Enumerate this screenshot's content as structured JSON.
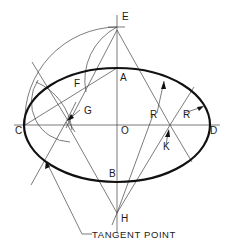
{
  "figure": {
    "labels": {
      "E": "E",
      "A": "A",
      "F": "F",
      "G": "G",
      "C": "C",
      "O": "O",
      "D": "D",
      "R1": "R",
      "R2": "R",
      "K": "K",
      "B": "B",
      "H": "H",
      "tangent_point": "TANGENT POINT"
    },
    "colors": {
      "line": "#444444",
      "ellipse": "#111111",
      "background": "#ffffff"
    }
  }
}
